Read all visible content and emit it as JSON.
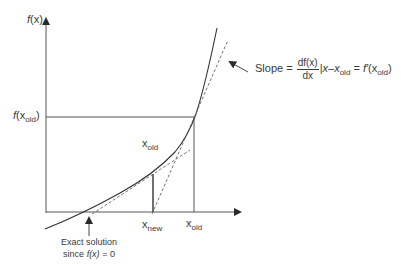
{
  "diagram": {
    "colors": {
      "ink": "#3a3a3a",
      "dashed": "#6a6a6a",
      "background": "#ffffff"
    },
    "axes": {
      "y_label_fn": "f",
      "y_label_arg": "(x)",
      "x_axis_label": ""
    },
    "labels": {
      "f_xold_fn": "f",
      "f_xold_open": "(x",
      "f_xold_sub": "old",
      "f_xold_close": ")",
      "xold_mid_base": "x",
      "xold_mid_sub": "old",
      "xnew_base": "x",
      "xnew_sub": "new",
      "xold_axis_base": "x",
      "xold_axis_sub": "old"
    },
    "slope_annotation": {
      "prefix": "Slope =",
      "numerator": "df(x)",
      "denominator": "dx",
      "eval_bar": "|",
      "eval_at": "x–x",
      "eval_sub": "old",
      "equals": "=",
      "result_fn": "f′",
      "result_open": "(x",
      "result_sub": "old",
      "result_close": ")"
    },
    "exact_solution": {
      "line1": "Exact solution",
      "line2_prefix": "since ",
      "line2_fn": "f(x)",
      "line2_suffix": " = 0"
    }
  }
}
